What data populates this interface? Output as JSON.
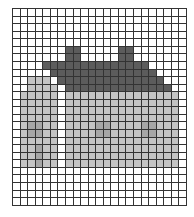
{
  "canvas": {
    "cols": 23,
    "rows": 26,
    "background": "#ffffff",
    "gridline": "#333333",
    "palette": {
      "0": "#ffffff",
      "D": "#5c5c5c",
      "L": "#c4c4c4",
      "M": "#a6a6a6"
    },
    "pixels": [
      "00000000000000000000000",
      "00000000000000000000000",
      "00000000000000000000000",
      "00000000000000000000000",
      "00000000000000000000000",
      "0000000DD00000DD0000000",
      "0000000DD00000DD0000000",
      "0000DDDDDDDDDDDDDD00000",
      "00000DDDDDDDDDDDDDD0000",
      "00LLL0DDDDDDDDDDDDDD000",
      "00LLLL0DDDDDDDDDDDDDD00",
      "0LLLLL0LLLLLLLLLLLLLLL0",
      "0LLLLL0LLLLLLLLLLLLLLL0",
      "0LLLLL0LLLLLLLLLLLLLLL0",
      "0LLLLL0LLLLLLLLLLLLLLL0",
      "0LMMLL0LLLLMMLLLLMMLLL0",
      "0LMMLL0LLLLMMLLLLMMLLL0",
      "0LLLLL0LLLLLLLLLLLLLLL0",
      "0LLMLL0LLLLLLLLLLLLLLL0",
      "0LLMLL0LLLLLLLLLLLLLLL0",
      "0LLMLL0LLLLLLLLLLLLLLL0",
      "00000000000000000000000",
      "00000000000000000000000",
      "00000000000000000000000",
      "00000000000000000000000",
      "00000000000000000000000"
    ]
  },
  "legend": {
    "D": "roof",
    "L": "wall",
    "M": "window-or-door"
  }
}
